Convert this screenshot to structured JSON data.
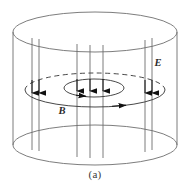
{
  "figure": {
    "caption": "(a)",
    "stroke_color": "#6e6e6e",
    "accent_color": "#1a1a1a",
    "background": "#ffffff",
    "labels": {
      "electric_field": "E",
      "magnetic_field": "B"
    },
    "geometry": {
      "cylinder": {
        "center_x": 95,
        "top_ellipse_cy": 32,
        "bottom_ellipse_cy": 145,
        "rx": 82,
        "ry": 20
      },
      "loops": [
        {
          "name": "outer-b-loop",
          "cx": 95,
          "cy": 90,
          "rx": 70,
          "ry": 17
        },
        {
          "name": "inner-b-loop",
          "cx": 94,
          "cy": 88,
          "rx": 30,
          "ry": 9
        }
      ],
      "field_line_x": [
        32,
        39,
        77,
        90,
        103,
        145,
        152
      ]
    },
    "field_lines": {
      "direction": "down",
      "count": 7,
      "arrow_y_outer": 90,
      "arrow_y_inner": 88
    },
    "loop_arrows": {
      "outer_direction": "clockwise-from-above",
      "inner_direction": "clockwise-from-above"
    }
  }
}
